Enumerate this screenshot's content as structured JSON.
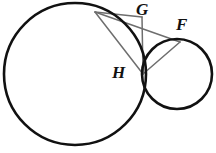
{
  "figure": {
    "background_color": "#ffffff",
    "width": 216,
    "height": 153
  },
  "style": {
    "circle_stroke_color": "#111111",
    "circle_stroke_width": 2.6,
    "chord_stroke_color": "#6e6e6e",
    "chord_stroke_width": 1.5,
    "label_color": "#111111",
    "label_font_size": 17
  },
  "shapes": {
    "circles": [
      {
        "name": "large-circle",
        "cx": 75,
        "cy": 74,
        "r": 71
      },
      {
        "name": "small-circle",
        "cx": 177,
        "cy": 74,
        "r": 35
      }
    ],
    "points": [
      {
        "name": "G",
        "x": 95,
        "y": 12
      },
      {
        "name": "F",
        "x": 180,
        "y": 42
      },
      {
        "name": "H",
        "x": 143,
        "y": 74
      },
      {
        "name": "apex",
        "x": 142,
        "y": 17
      }
    ],
    "segments": [
      {
        "name": "segment-G-to-H",
        "x1": 95,
        "y1": 12,
        "x2": 143,
        "y2": 74
      },
      {
        "name": "segment-G-to-F",
        "x1": 95,
        "y1": 12,
        "x2": 180,
        "y2": 42
      },
      {
        "name": "segment-H-to-F",
        "x1": 143,
        "y1": 74,
        "x2": 180,
        "y2": 42
      },
      {
        "name": "segment-apex-to-H",
        "x1": 142,
        "y1": 17,
        "x2": 143,
        "y2": 74
      },
      {
        "name": "segment-G-to-apex",
        "x1": 95,
        "y1": 12,
        "x2": 142,
        "y2": 17
      }
    ]
  },
  "labels": {
    "G": {
      "text": "G",
      "x": 136,
      "y": 1
    },
    "F": {
      "text": "F",
      "x": 176,
      "y": 16
    },
    "H": {
      "text": "H",
      "x": 112,
      "y": 64
    }
  }
}
